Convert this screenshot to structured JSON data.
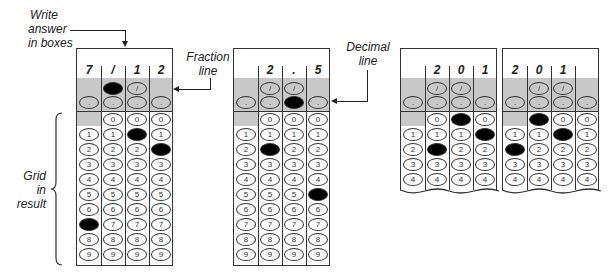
{
  "labels": {
    "write_answer": [
      "Write",
      "answer",
      "in boxes"
    ],
    "fraction_line": [
      "Fraction",
      "line"
    ],
    "decimal_line": [
      "Decimal",
      "line"
    ],
    "grid_in_result": [
      "Grid",
      "in",
      "result"
    ]
  },
  "symbols": {
    "slash": "/",
    "dot": ".",
    "digits": [
      "0",
      "1",
      "2",
      "3",
      "4",
      "5",
      "6",
      "7",
      "8",
      "9"
    ]
  },
  "grids": [
    {
      "id": "grid-fraction",
      "answer_boxes": [
        "7",
        "/",
        "1",
        "2"
      ],
      "filled": {
        "slash": [
          1
        ],
        "dot": [],
        "digits": {
          "0": "7",
          "2": "1",
          "3": "2"
        }
      },
      "rows": 10,
      "torn": false
    },
    {
      "id": "grid-decimal",
      "answer_boxes": [
        "",
        "2",
        ".",
        "5"
      ],
      "filled": {
        "slash": [],
        "dot": [
          2
        ],
        "digits": {
          "1": "2",
          "3": "5"
        }
      },
      "rows": 10,
      "torn": false
    },
    {
      "id": "grid-201-right",
      "answer_boxes": [
        "",
        "2",
        "0",
        "1"
      ],
      "filled": {
        "slash": [],
        "dot": [],
        "digits": {
          "1": "2",
          "2": "0",
          "3": "1"
        }
      },
      "rows": 5,
      "torn": true
    },
    {
      "id": "grid-201-left",
      "answer_boxes": [
        "2",
        "0",
        "1",
        ""
      ],
      "filled": {
        "slash": [],
        "dot": [],
        "digits": {
          "0": "2",
          "1": "0",
          "2": "1"
        }
      },
      "rows": 5,
      "torn": true
    }
  ]
}
